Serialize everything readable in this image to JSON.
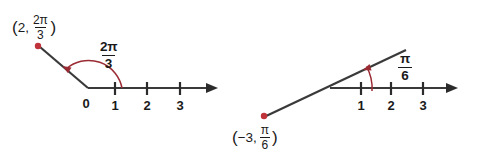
{
  "figure": {
    "background_color": "#ffffff",
    "axis_color": "#3a3a3a",
    "accent_color": "#9b2b33",
    "point_color": "#c0333a"
  },
  "diagrams": [
    {
      "id": "left-polar-plot",
      "point_label": {
        "open_paren": "(",
        "radius": "2",
        "comma": ",",
        "angle_numerator": "2π",
        "angle_denominator": "3",
        "close_paren": ")"
      },
      "angle_label": {
        "numerator": "2π",
        "denominator": "3"
      },
      "origin_label": "0",
      "tick_labels": [
        "1",
        "2",
        "3"
      ],
      "arc_direction": "counterclockwise",
      "ray_direction": "upper-left"
    },
    {
      "id": "right-polar-plot",
      "point_label": {
        "open_paren": "(",
        "radius": "−3",
        "comma": ",",
        "angle_numerator": "π",
        "angle_denominator": "6",
        "close_paren": ")"
      },
      "angle_label": {
        "numerator": "π",
        "denominator": "6"
      },
      "origin_label": "",
      "tick_labels": [
        "1",
        "2",
        "3"
      ],
      "arc_direction": "counterclockwise",
      "ray_direction": "lower-left"
    }
  ]
}
